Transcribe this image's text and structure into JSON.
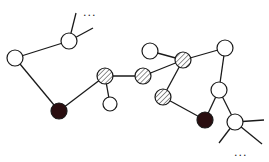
{
  "diagram": {
    "type": "network-graph",
    "colors": {
      "edge": "#1a1a1a",
      "white_node": "#ffffff",
      "black_node": "#2a0e10",
      "hatch": "#555555"
    },
    "nodes": [
      {
        "id": "A",
        "x": 15,
        "y": 58,
        "r": 8,
        "style": "white"
      },
      {
        "id": "B",
        "x": 69,
        "y": 41,
        "r": 8,
        "style": "white"
      },
      {
        "id": "C",
        "x": 59,
        "y": 111,
        "r": 8,
        "style": "black"
      },
      {
        "id": "D",
        "x": 105,
        "y": 76,
        "r": 8,
        "style": "hatched"
      },
      {
        "id": "E",
        "x": 110,
        "y": 104,
        "r": 7,
        "style": "white"
      },
      {
        "id": "F",
        "x": 143,
        "y": 76,
        "r": 8,
        "style": "hatched"
      },
      {
        "id": "G",
        "x": 150,
        "y": 51,
        "r": 8,
        "style": "white"
      },
      {
        "id": "H",
        "x": 183,
        "y": 60,
        "r": 8,
        "style": "hatched"
      },
      {
        "id": "I",
        "x": 163,
        "y": 97,
        "r": 8,
        "style": "hatched"
      },
      {
        "id": "J",
        "x": 225,
        "y": 48,
        "r": 8,
        "style": "white"
      },
      {
        "id": "K",
        "x": 219,
        "y": 90,
        "r": 8,
        "style": "white"
      },
      {
        "id": "L",
        "x": 205,
        "y": 120,
        "r": 8,
        "style": "black"
      },
      {
        "id": "M",
        "x": 235,
        "y": 122,
        "r": 8,
        "style": "white"
      }
    ],
    "edges": [
      [
        "A",
        "B"
      ],
      [
        "A",
        "C"
      ],
      [
        "C",
        "D"
      ],
      [
        "D",
        "E"
      ],
      [
        "D",
        "F"
      ],
      [
        "F",
        "H"
      ],
      [
        "G",
        "H"
      ],
      [
        "H",
        "J"
      ],
      [
        "H",
        "I"
      ],
      [
        "I",
        "L"
      ],
      [
        "J",
        "K"
      ],
      [
        "K",
        "L"
      ],
      [
        "K",
        "M"
      ]
    ],
    "open_edges": [
      {
        "from": "B",
        "to": [
          76,
          13
        ]
      },
      {
        "from": "B",
        "to": [
          93,
          28
        ]
      },
      {
        "from": "M",
        "to": [
          264,
          120
        ]
      },
      {
        "from": "M",
        "to": [
          262,
          144
        ]
      },
      {
        "from": "M",
        "to": [
          219,
          143
        ]
      }
    ],
    "annotations": [
      {
        "text": "...",
        "x": 83,
        "y": 16
      },
      {
        "text": "...",
        "x": 234,
        "y": 156
      }
    ]
  }
}
